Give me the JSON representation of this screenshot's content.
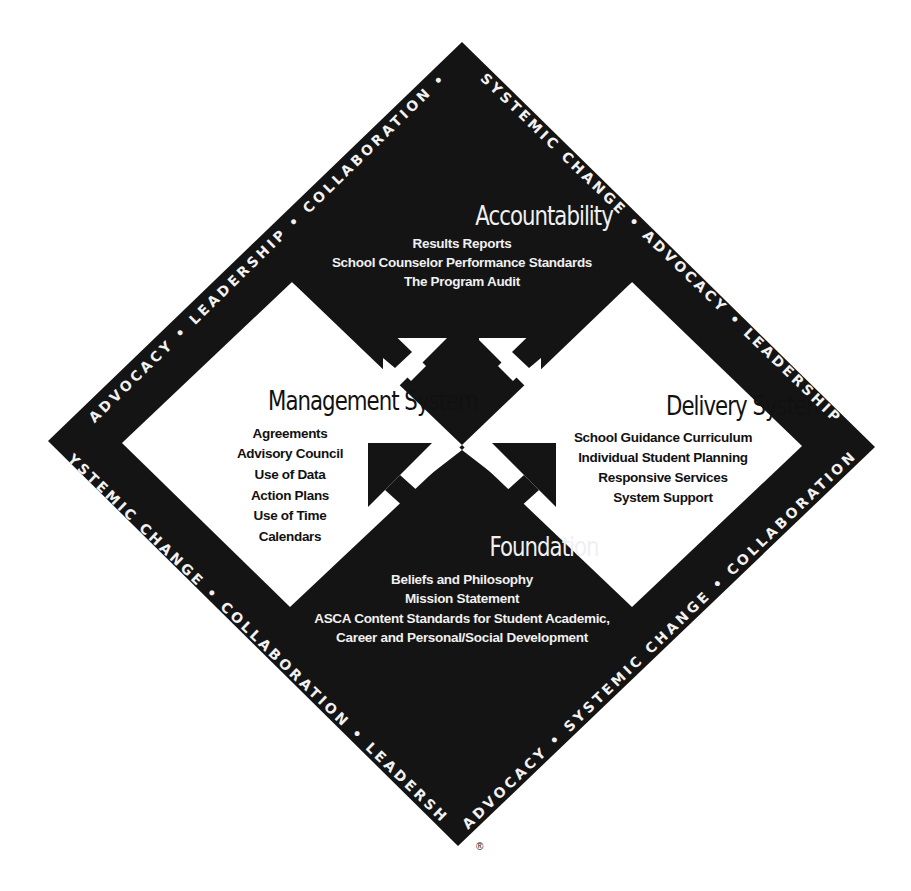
{
  "top_cut_text": "",
  "colors": {
    "background": "#ffffff",
    "diamond": "#141414",
    "light_text": "#f0f0f0",
    "dark_text": "#111111"
  },
  "diagram": {
    "sections": {
      "accountability": {
        "title": "Accountability",
        "items": [
          "Results Reports",
          "School Counselor Performance Standards",
          "The Program Audit"
        ]
      },
      "management": {
        "title": "Management System",
        "items": [
          "Agreements",
          "Advisory Council",
          "Use of Data",
          "Action Plans",
          "Use of Time",
          "Calendars"
        ]
      },
      "delivery": {
        "title": "Delivery System",
        "items": [
          "School Guidance Curriculum",
          "Individual Student Planning",
          "Responsive Services",
          "System Support"
        ]
      },
      "foundation": {
        "title": "Foundation",
        "items": [
          "Beliefs and Philosophy",
          "Mission Statement",
          "ASCA Content Standards for Student Academic,",
          "Career and Personal/Social Development"
        ]
      }
    },
    "border": {
      "top_left": "ADVOCACY  •  LEADERSHIP  •  COLLABORATION  •",
      "top_right": "SYSTEMIC CHANGE  •  ADVOCACY  •  LEADERSHIP",
      "bottom_left": "•  SYSTEMIC CHANGE  •  COLLABORATION  •  LEADERSHIP  •",
      "bottom_right": "ADVOCACY  •  SYSTEMIC CHANGE  •  COLLABORATION"
    },
    "registered_mark": "®",
    "arrows": [
      "black-down-arrow",
      "white-up-left-arrow",
      "white-up-right-arrow",
      "black-up-left-arrow",
      "black-up-right-arrow"
    ]
  }
}
